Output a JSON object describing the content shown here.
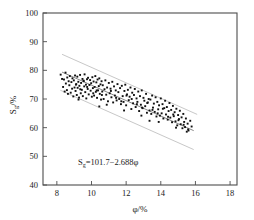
{
  "chart_data": {
    "type": "scatter",
    "title": "",
    "xlabel": "φ/%",
    "ylabel": "Sg/%",
    "ylabel_main": "S",
    "ylabel_sub": "g",
    "ylabel_tail": "/%",
    "xlabel_main": "φ",
    "xlabel_tail": "/%",
    "xlim": [
      7.2,
      18.4
    ],
    "ylim": [
      40,
      100
    ],
    "xticks": [
      8,
      10,
      12,
      14,
      16,
      18
    ],
    "xtick_labels": [
      "8",
      "10",
      "12",
      "14",
      "16",
      "18"
    ],
    "yticks": [
      40,
      50,
      60,
      70,
      80,
      90,
      100
    ],
    "ytick_labels": [
      "40",
      "50",
      "60",
      "70",
      "80",
      "90",
      "100"
    ],
    "grid": false,
    "legend": "none",
    "annotation": {
      "text_main": "=101.7−2.688",
      "text_var": "S",
      "text_sub": "g",
      "text_phi": "φ",
      "full": "Sg=101.7−2.688φ",
      "x": 11.0,
      "y": 48.0
    },
    "fit_line": {
      "name": "regression",
      "equation": "Sg = 101.7 - 2.688*phi",
      "intercept": 101.7,
      "slope": -2.688,
      "x_start": 8.3,
      "x_end": 15.9,
      "color": "#7a7a7a"
    },
    "band_upper": {
      "name": "upper-envelope",
      "offset": 6.2,
      "x_start": 8.3,
      "x_end": 16.1,
      "color": "#c8c8c8"
    },
    "band_lower": {
      "name": "lower-envelope",
      "offset": -6.6,
      "x_start": 8.2,
      "x_end": 15.9,
      "color": "#c8c8c8"
    },
    "marker": {
      "shape": "square",
      "size": 1.9,
      "color": "#111111"
    },
    "n_points": 201,
    "x": [
      8.22,
      8.3,
      8.36,
      8.41,
      8.45,
      8.5,
      8.52,
      8.58,
      8.6,
      8.64,
      8.68,
      8.72,
      8.75,
      8.8,
      8.84,
      8.88,
      8.9,
      8.95,
      8.98,
      9.02,
      9.05,
      9.08,
      9.12,
      9.15,
      9.18,
      9.2,
      9.24,
      9.28,
      9.3,
      9.34,
      9.38,
      9.4,
      9.44,
      9.48,
      9.5,
      9.54,
      9.58,
      9.6,
      9.64,
      9.68,
      9.7,
      9.74,
      9.78,
      9.8,
      9.84,
      9.88,
      9.92,
      9.95,
      9.98,
      10.02,
      10.05,
      10.08,
      10.12,
      10.15,
      10.18,
      10.22,
      10.25,
      10.28,
      10.32,
      10.35,
      10.38,
      10.42,
      10.45,
      10.48,
      10.52,
      10.55,
      10.58,
      10.62,
      10.65,
      10.7,
      10.75,
      10.8,
      10.85,
      10.9,
      10.95,
      11.0,
      11.05,
      11.1,
      11.15,
      11.2,
      11.25,
      11.3,
      11.35,
      11.4,
      11.45,
      11.5,
      11.55,
      11.6,
      11.65,
      11.7,
      11.75,
      11.8,
      11.85,
      11.9,
      11.95,
      12.0,
      12.05,
      12.1,
      12.15,
      12.2,
      12.25,
      12.3,
      12.35,
      12.4,
      12.45,
      12.5,
      12.55,
      12.6,
      12.65,
      12.7,
      12.75,
      12.8,
      12.85,
      12.9,
      12.95,
      13.0,
      13.05,
      13.1,
      13.15,
      13.2,
      13.25,
      13.3,
      13.35,
      13.4,
      13.45,
      13.5,
      13.55,
      13.6,
      13.65,
      13.7,
      13.75,
      13.8,
      13.85,
      13.9,
      13.95,
      14.0,
      14.05,
      14.1,
      14.15,
      14.2,
      14.25,
      14.3,
      14.35,
      14.4,
      14.45,
      14.5,
      14.55,
      14.6,
      14.65,
      14.7,
      14.75,
      14.8,
      14.85,
      14.9,
      14.95,
      15.0,
      15.05,
      15.1,
      15.15,
      15.2,
      15.25,
      15.3,
      15.35,
      15.4,
      15.45,
      15.5,
      15.55,
      15.6,
      15.7,
      15.78,
      9.1,
      9.35,
      9.55,
      9.75,
      10.1,
      10.3,
      10.6,
      11.12,
      11.42,
      11.72,
      12.02,
      12.32,
      12.62,
      12.92,
      13.22,
      13.52,
      13.82,
      14.12,
      14.42,
      14.72,
      15.02,
      15.32,
      15.58,
      10.88,
      11.88,
      12.88,
      13.88,
      14.88,
      9.25,
      10.45,
      13.35
    ],
    "y": [
      78.5,
      77.0,
      74.2,
      76.8,
      72.6,
      79.2,
      75.4,
      73.1,
      77.5,
      71.8,
      76.2,
      74.8,
      78.0,
      72.2,
      75.9,
      73.6,
      77.2,
      70.9,
      76.5,
      74.0,
      78.2,
      72.8,
      75.2,
      71.4,
      77.8,
      73.9,
      76.0,
      70.5,
      74.6,
      78.4,
      72.0,
      75.6,
      73.2,
      77.0,
      71.0,
      76.4,
      74.4,
      78.6,
      72.4,
      75.0,
      70.2,
      76.9,
      73.5,
      77.4,
      71.6,
      74.9,
      76.6,
      72.9,
      75.5,
      70.8,
      77.6,
      73.8,
      76.1,
      71.2,
      74.2,
      78.0,
      72.5,
      75.8,
      70.4,
      76.8,
      73.0,
      74.5,
      77.2,
      71.8,
      75.1,
      69.8,
      76.2,
      72.6,
      74.8,
      70.0,
      73.4,
      76.5,
      71.5,
      74.0,
      69.2,
      75.6,
      72.0,
      73.6,
      70.6,
      76.0,
      68.8,
      74.4,
      71.2,
      73.0,
      69.5,
      75.2,
      72.4,
      70.0,
      73.8,
      68.2,
      74.6,
      71.0,
      69.0,
      72.8,
      75.0,
      67.8,
      71.6,
      73.2,
      69.6,
      70.8,
      74.0,
      66.5,
      72.2,
      68.5,
      71.4,
      73.5,
      67.2,
      70.2,
      69.0,
      72.6,
      65.8,
      71.0,
      68.0,
      73.0,
      66.8,
      70.4,
      69.4,
      67.5,
      71.8,
      65.2,
      68.8,
      70.0,
      66.0,
      69.8,
      64.8,
      71.2,
      67.0,
      68.4,
      65.5,
      70.6,
      63.9,
      69.0,
      66.4,
      67.8,
      64.2,
      70.2,
      65.0,
      68.2,
      63.2,
      66.8,
      69.4,
      64.6,
      67.2,
      62.8,
      65.8,
      68.6,
      63.5,
      66.2,
      61.9,
      67.6,
      64.0,
      65.4,
      62.2,
      66.6,
      60.8,
      64.4,
      63.0,
      65.9,
      61.2,
      63.6,
      59.8,
      64.8,
      62.0,
      60.2,
      63.2,
      58.6,
      61.4,
      59.0,
      62.4,
      60.4,
      75.0,
      73.4,
      76.2,
      74.2,
      72.0,
      73.0,
      71.4,
      72.8,
      70.4,
      69.2,
      71.2,
      70.0,
      68.2,
      67.0,
      68.6,
      66.2,
      65.0,
      66.6,
      63.8,
      64.6,
      62.6,
      61.0,
      59.4,
      68.0,
      66.0,
      64.2,
      62.0,
      60.0,
      69.8,
      67.4,
      62.4
    ]
  },
  "axis": {
    "x_title_main": "φ",
    "x_title_tail": "/%",
    "y_title_main": "S",
    "y_title_sub": "g",
    "y_title_tail": "/%"
  },
  "colors": {
    "frame": "#4d4d4d",
    "point": "#111111",
    "band": "#c8c8c8",
    "fit": "#7a7a7a",
    "background": "#ffffff"
  }
}
